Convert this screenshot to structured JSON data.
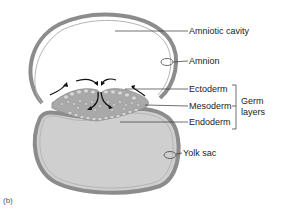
{
  "figure": {
    "panel_label": "(b)",
    "colors": {
      "membrane": "#8c8c8c",
      "membrane_inner": "#b5b5b5",
      "yolk_fill": "#cfcfcf",
      "germ_disc": "#a9a9a9",
      "cell_fill": "#d8d8d8",
      "arrow": "#111111",
      "leader_line": "#333333"
    }
  },
  "labels": {
    "amniotic_cavity": "Amniotic cavity",
    "amnion": "Amnion",
    "ectoderm": "Ectoderm",
    "mesoderm": "Mesoderm",
    "endoderm": "Endoderm",
    "germ_layers_line1": "Germ",
    "germ_layers_line2": "layers",
    "yolk_sac": "Yolk sac"
  }
}
